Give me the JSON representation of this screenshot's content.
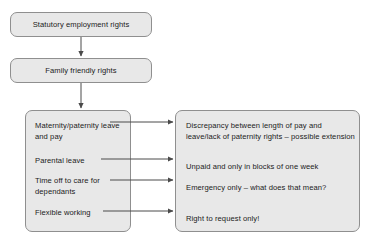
{
  "diagram": {
    "type": "flowchart",
    "colors": {
      "node_fill": "#e8e8e8",
      "node_border": "#8f8f8f",
      "text": "#1b1b1b",
      "connector": "#4a4a4a",
      "background": "#ffffff"
    },
    "top_nodes": [
      {
        "id": "statutory",
        "label": "Statutory employment rights"
      },
      {
        "id": "family",
        "label": "Family friendly rights"
      }
    ],
    "left_panel": {
      "name": "rights-list",
      "items": [
        {
          "id": "maternity",
          "label": "Maternity/paternity leave and pay"
        },
        {
          "id": "parental",
          "label": "Parental leave"
        },
        {
          "id": "dependants",
          "label": "Time off to care for dependants"
        },
        {
          "id": "flexible",
          "label": "Flexible working"
        }
      ]
    },
    "right_panel": {
      "name": "issues-list",
      "items": [
        {
          "id": "maternity-issue",
          "label": "Discrepancy between length of pay and leave/lack of paternity rights – possible extension"
        },
        {
          "id": "parental-issue",
          "label": "Unpaid and only in blocks of one week"
        },
        {
          "id": "dependants-issue",
          "label": "Emergency only – what does that mean?"
        },
        {
          "id": "flexible-issue",
          "label": "Right to request only!"
        }
      ]
    },
    "connectors": [
      {
        "id": "statutory-to-family",
        "kind": "vertical-arrow"
      },
      {
        "id": "family-to-panels",
        "kind": "vertical-arrow"
      },
      {
        "id": "maternity-to-issue",
        "kind": "horizontal-arrow"
      },
      {
        "id": "parental-to-issue",
        "kind": "horizontal-arrow"
      },
      {
        "id": "dependants-to-issue",
        "kind": "horizontal-arrow"
      },
      {
        "id": "flexible-to-issue",
        "kind": "horizontal-arrow"
      }
    ]
  }
}
